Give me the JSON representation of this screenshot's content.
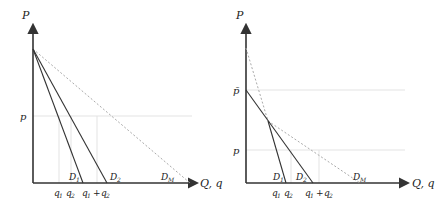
{
  "panels": [
    {
      "id": "left",
      "y_axis_label": "P",
      "x_axis_label": "Q, q",
      "price_labels": [
        {
          "text": "p",
          "y": 116
        }
      ],
      "curves": [
        {
          "name": "D1",
          "label": "D",
          "sub": "1",
          "style": "solid"
        },
        {
          "name": "D2",
          "label": "D",
          "sub": "2",
          "style": "solid"
        },
        {
          "name": "DM",
          "label": "D",
          "sub": "M",
          "style": "dashed"
        }
      ],
      "quantity_labels": [
        {
          "text": "q",
          "sub": "1"
        },
        {
          "text": "q",
          "sub": "2"
        },
        {
          "text": "q",
          "sub": "1",
          "plus": " + q",
          "sub2": "2"
        }
      ]
    },
    {
      "id": "right",
      "y_axis_label": "P",
      "x_axis_label": "Q, q",
      "price_labels": [
        {
          "text": "p̄",
          "y": 90
        },
        {
          "text": "p",
          "y": 150
        }
      ],
      "curves": [
        {
          "name": "D1",
          "label": "D",
          "sub": "1",
          "style": "solid-with-dashed-top"
        },
        {
          "name": "D2",
          "label": "D",
          "sub": "2",
          "style": "solid"
        },
        {
          "name": "DM",
          "label": "D",
          "sub": "M",
          "style": "dashed"
        }
      ],
      "quantity_labels": [
        {
          "text": "q",
          "sub": "1"
        },
        {
          "text": "q",
          "sub": "2"
        },
        {
          "text": "q",
          "sub": "1",
          "plus": " + q",
          "sub2": "2"
        }
      ]
    }
  ],
  "text": {
    "P": "P",
    "Qq": "Q, q",
    "p": "p",
    "pbar": "p̄",
    "D": "D",
    "q": "q",
    "s1": "1",
    "s2": "2",
    "sM": "M",
    "plus": "+"
  }
}
